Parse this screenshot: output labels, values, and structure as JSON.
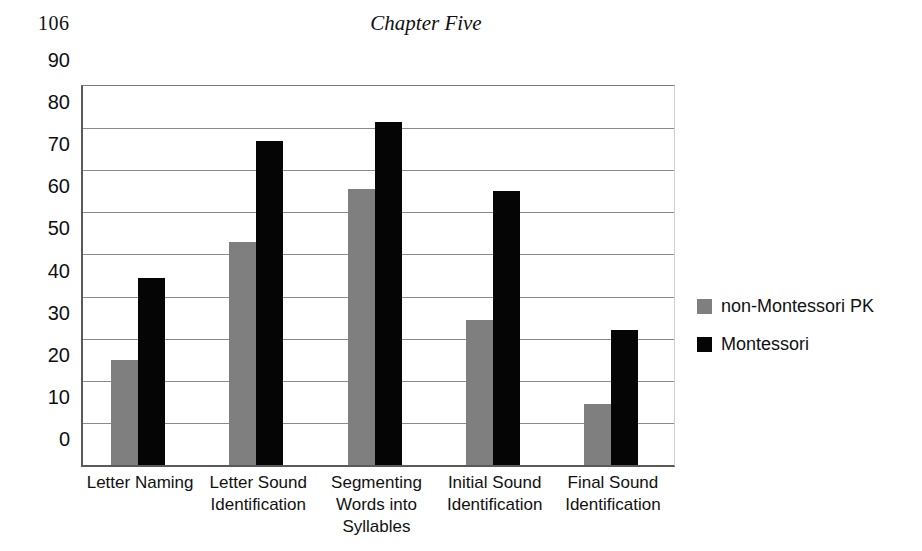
{
  "page": {
    "number": "106",
    "running_head": "Chapter Five"
  },
  "legend": {
    "position": "right",
    "items": [
      {
        "label": "non-Montessori PK",
        "color": "#7f7f7f",
        "swatch": "square-swatch-gray"
      },
      {
        "label": "Montessori",
        "color": "#050505",
        "swatch": "square-swatch-black"
      }
    ]
  },
  "chart_data": {
    "type": "bar",
    "title": "",
    "xlabel": "",
    "ylabel": "",
    "ylim": [
      0,
      90
    ],
    "yticks": [
      "0",
      "10",
      "20",
      "30",
      "40",
      "50",
      "60",
      "70",
      "80",
      "90"
    ],
    "grid": true,
    "legend_position": "right",
    "categories": [
      "Letter Naming",
      "Letter Sound Identification",
      "Segmenting Words into Syllables",
      "Initial Sound Identification",
      "Final Sound Identification"
    ],
    "series": [
      {
        "name": "non-Montessori PK",
        "color": "#7f7f7f",
        "values": [
          25,
          53,
          65.5,
          34.5,
          14.5
        ]
      },
      {
        "name": "Montessori",
        "color": "#050505",
        "values": [
          44.5,
          77,
          81.5,
          65,
          32
        ]
      }
    ]
  }
}
